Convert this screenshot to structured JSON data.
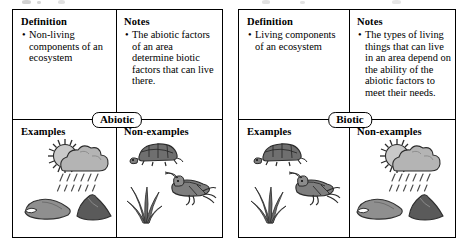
{
  "document": {
    "kind": "concept-definition-map-worksheet",
    "panels": [
      {
        "id": "abiotic",
        "center_label": "Abiotic",
        "quadrants": {
          "definition": {
            "heading": "Definition",
            "bullets": [
              "Non-living components of an ecosystem"
            ]
          },
          "notes": {
            "heading": "Notes",
            "bullets": [
              "The abiotic factors of an area determine biotic factors that can live there."
            ]
          },
          "examples": {
            "heading": "Examples",
            "illustrations": [
              "sun-behind-raincloud-icon",
              "rock-icon",
              "rock-icon"
            ]
          },
          "non_examples": {
            "heading": "Non-examples",
            "illustrations": [
              "turtle-icon",
              "grass-icon",
              "grasshopper-icon"
            ]
          }
        }
      },
      {
        "id": "biotic",
        "center_label": "Biotic",
        "quadrants": {
          "definition": {
            "heading": "Definition",
            "bullets": [
              "Living components of an ecosystem"
            ]
          },
          "notes": {
            "heading": "Notes",
            "bullets": [
              "The types of living things that can live in an area depend on the ability of the abiotic factors to meet their needs."
            ]
          },
          "examples": {
            "heading": "Examples",
            "illustrations": [
              "turtle-icon",
              "grass-icon",
              "grasshopper-icon"
            ]
          },
          "non_examples": {
            "heading": "Non-examples",
            "illustrations": [
              "sun-behind-raincloud-icon",
              "rock-icon",
              "rock-icon"
            ]
          }
        }
      }
    ],
    "bullet_glyph": "•"
  },
  "colors": {
    "ink": "#000000",
    "paper": "#ffffff",
    "cloud_fill": "#b4b4b4",
    "cloud_shade": "#8e8e8e",
    "sun_fill": "#c9c9c9",
    "rock_light": "#8f8f8f",
    "rock_dark": "#5a5a5a",
    "animal_fill": "#7e7e7e",
    "animal_dark": "#4a4a4a",
    "grass_fill": "#6b6b6b"
  }
}
